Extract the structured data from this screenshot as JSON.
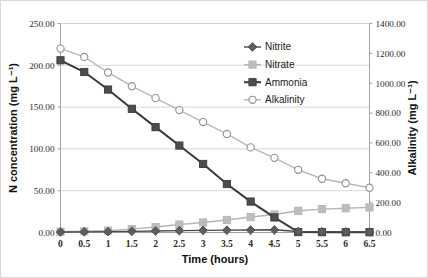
{
  "chart_data": {
    "type": "line",
    "title": "",
    "xlabel": "Time (hours)",
    "ylabel": "N concentration (mg L⁻¹)",
    "y2label": "Alkalinity (mg L⁻¹)",
    "grid": true,
    "legend_position": "inside-top-right",
    "x": [
      0,
      0.5,
      1,
      1.5,
      2,
      2.5,
      3,
      3.5,
      4,
      4.5,
      5,
      5.5,
      6,
      6.5
    ],
    "categories": [
      "0",
      "0.5",
      "1",
      "1.5",
      "2",
      "2.5",
      "3",
      "3.5",
      "4",
      "4.5",
      "5",
      "5.5",
      "6",
      "6.5"
    ],
    "ylim": [
      0,
      250
    ],
    "yticks": [
      0,
      50,
      100,
      150,
      200,
      250
    ],
    "ytick_labels": [
      "0.00",
      "50.00",
      "100.00",
      "150.00",
      "200.00",
      "250.00"
    ],
    "y2lim": [
      0,
      1400
    ],
    "y2ticks": [
      0,
      200,
      400,
      600,
      800,
      1000,
      1200,
      1400
    ],
    "y2tick_labels": [
      "0.00",
      "200.00",
      "400.00",
      "600.00",
      "800.00",
      "1000.00",
      "1200.00",
      "1400.00"
    ],
    "series": [
      {
        "name": "Nitrite",
        "axis": "left",
        "marker": "diamond",
        "color": "#5e5e5e",
        "line_color": "#4a4a4a",
        "values": [
          0.6,
          0.8,
          1.0,
          1.4,
          1.8,
          2.2,
          2.6,
          2.8,
          3.0,
          3.2,
          1.2,
          0.9,
          0.7,
          0.6
        ]
      },
      {
        "name": "Nitrate",
        "axis": "left",
        "marker": "square",
        "color": "#bdbdbd",
        "line_color": "#b5b5b5",
        "values": [
          1.0,
          1.5,
          2.2,
          4.0,
          6.5,
          9.5,
          12.0,
          15.0,
          18.5,
          21.5,
          26.0,
          28.0,
          29.0,
          30.0
        ]
      },
      {
        "name": "Ammonia",
        "axis": "left",
        "marker": "square",
        "color": "#4d4d4d",
        "line_color": "#3a3a3a",
        "values": [
          206.0,
          192.0,
          171.0,
          148.0,
          126.0,
          104.0,
          82.0,
          58.0,
          37.0,
          18.0,
          0.5,
          0.4,
          0.3,
          0.3
        ]
      },
      {
        "name": "Alkalinity",
        "axis": "right",
        "marker": "circle-open",
        "color": "#ffffff",
        "line_color": "#b8b8b8",
        "values": [
          1232,
          1176,
          1072,
          980,
          900,
          820,
          740,
          660,
          570,
          500,
          420,
          360,
          330,
          300
        ]
      }
    ]
  },
  "legend": {
    "entries": [
      {
        "label": "Nitrite"
      },
      {
        "label": "Nitrate"
      },
      {
        "label": "Ammonia"
      },
      {
        "label": "Alkalinity"
      }
    ]
  },
  "colors": {
    "nitrite": "#5e5e5e",
    "nitrate": "#bdbdbd",
    "ammonia": "#4d4d4d",
    "alkalinity_line": "#b8b8b8",
    "grid": "#cfcfcf",
    "axis": "#9a9a9a",
    "text": "#1a1a1a"
  }
}
